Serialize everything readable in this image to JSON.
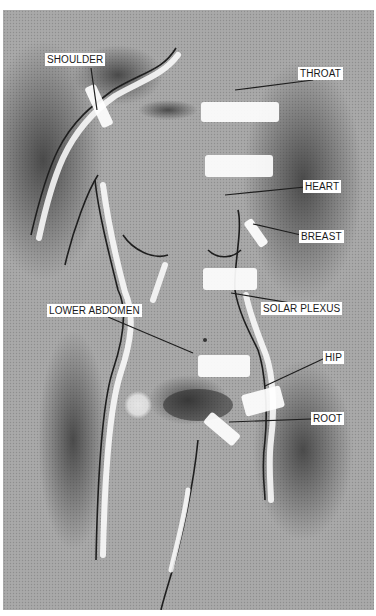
{
  "diagram": {
    "background_color": "#a9a9a9",
    "label_background": "#ffffff",
    "label_text_color": "#1a1a1a",
    "line_color": "#1e1e1e",
    "highlight_color": "#ffffff",
    "labels": [
      {
        "id": "shoulder",
        "text": "SHOULDER",
        "x": 42,
        "y": 43,
        "line": [
          88,
          58,
          94,
          100
        ],
        "mark": {
          "x": 74,
          "y": 90,
          "w": 44,
          "h": 12,
          "rot": 65
        }
      },
      {
        "id": "throat",
        "text": "THROAT",
        "x": 295,
        "y": 57,
        "line": [
          310,
          70,
          232,
          80
        ],
        "mark": {
          "x": 198,
          "y": 92,
          "w": 78,
          "h": 20,
          "rot": 0
        }
      },
      {
        "id": "heart",
        "text": "HEART",
        "x": 300,
        "y": 170,
        "line": [
          302,
          177,
          222,
          185
        ],
        "mark": {
          "x": 202,
          "y": 145,
          "w": 68,
          "h": 22,
          "rot": 0
        }
      },
      {
        "id": "breast",
        "text": "BREAST",
        "x": 296,
        "y": 220,
        "line": [
          298,
          225,
          250,
          214
        ],
        "mark": {
          "x": 238,
          "y": 218,
          "w": 30,
          "h": 10,
          "rot": 55
        }
      },
      {
        "id": "solar_plexus",
        "text": "SOLAR PLEXUS",
        "x": 258,
        "y": 292,
        "line": [
          300,
          295,
          228,
          283
        ],
        "mark": {
          "x": 200,
          "y": 258,
          "w": 54,
          "h": 22,
          "rot": 0
        }
      },
      {
        "id": "lower_abdomen",
        "text": "LOWER ABDOMEN",
        "x": 44,
        "y": 294,
        "line": [
          105,
          307,
          190,
          343
        ],
        "mark": {
          "x": 195,
          "y": 345,
          "w": 52,
          "h": 22,
          "rot": 0
        }
      },
      {
        "id": "hip",
        "text": "HIP",
        "x": 320,
        "y": 341,
        "line": [
          322,
          348,
          262,
          376
        ],
        "mark": {
          "x": 240,
          "y": 380,
          "w": 40,
          "h": 22,
          "rot": -15
        }
      },
      {
        "id": "root",
        "text": "ROOT",
        "x": 308,
        "y": 402,
        "line": [
          308,
          409,
          226,
          412
        ],
        "mark": {
          "x": 200,
          "y": 412,
          "w": 38,
          "h": 14,
          "rot": 40
        }
      }
    ]
  }
}
